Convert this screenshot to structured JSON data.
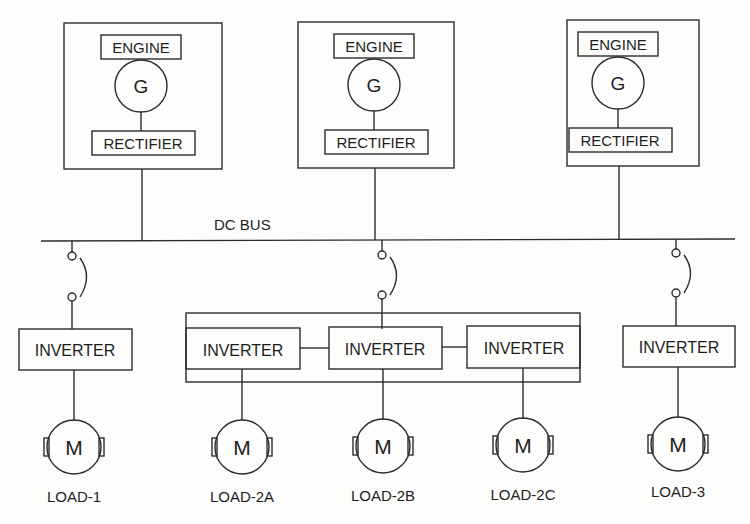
{
  "diagram": {
    "bus_label": "DC BUS",
    "generator_sets": [
      {
        "engine_label": "ENGINE",
        "generator_symbol": "G",
        "rectifier_label": "RECTIFIER"
      },
      {
        "engine_label": "ENGINE",
        "generator_symbol": "G",
        "rectifier_label": "RECTIFIER"
      },
      {
        "engine_label": "ENGINE",
        "generator_symbol": "G",
        "rectifier_label": "RECTIFIER"
      }
    ],
    "inverters": [
      {
        "label": "INVERTER"
      },
      {
        "label": "INVERTER"
      },
      {
        "label": "INVERTER"
      },
      {
        "label": "INVERTER"
      },
      {
        "label": "INVERTER"
      }
    ],
    "motors": [
      {
        "symbol": "M",
        "label": "LOAD-1"
      },
      {
        "symbol": "M",
        "label": "LOAD-2A"
      },
      {
        "symbol": "M",
        "label": "LOAD-2B"
      },
      {
        "symbol": "M",
        "label": "LOAD-2C"
      },
      {
        "symbol": "M",
        "label": "LOAD-3"
      }
    ]
  }
}
